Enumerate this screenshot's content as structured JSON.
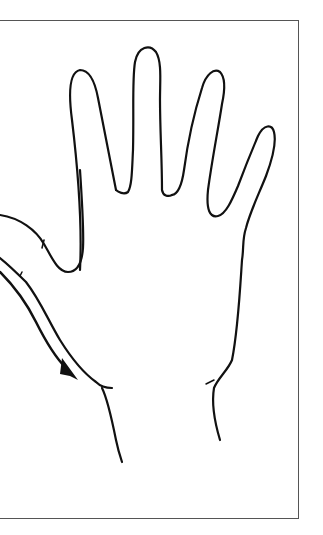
{
  "figure": {
    "stroke_color": "#111111",
    "frame_color": "#555555",
    "background": "#ffffff"
  },
  "annotations": {
    "arrow": "down-right arrow along wrist crease"
  }
}
